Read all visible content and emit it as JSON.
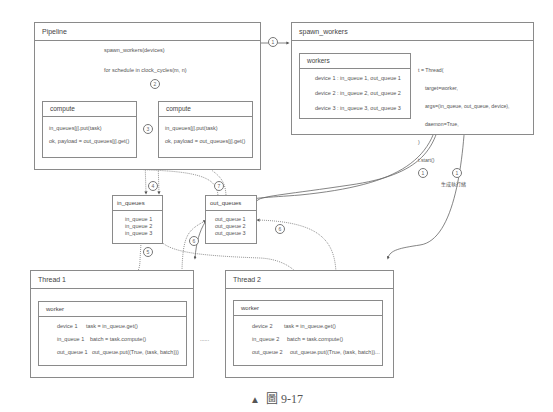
{
  "pipeline": {
    "title": "Pipeline",
    "spawn_call": "spawn_workers(devices)",
    "loop": "for schedule in clock_cycles(m, n)",
    "compute_boxes": [
      {
        "title": "compute",
        "line1": "in_queues[j].put(task)",
        "line2": "ok, payload = out_queues[j].get()"
      },
      {
        "title": "compute",
        "line1": "in_queues[j].put(task)",
        "line2": "ok, payload = out_queues[j].get()"
      }
    ]
  },
  "spawn_workers": {
    "title": "spawn_workers",
    "workers": {
      "title": "workers",
      "rows": [
        "device 1 : in_queue 1, out_queue 1",
        "device 2 : in_queue 2, out_queue 2",
        "device 3 : in_queue 3, out_queue 3"
      ]
    },
    "code": [
      "t = Thread(",
      "  target=worker,",
      "  args=(in_queue, out_queue, device),",
      "  daemon=True,",
      ")",
      "t.start()"
    ]
  },
  "annotation": "生成執行緒",
  "in_queues": {
    "title": "in_queues",
    "items": [
      "in_queue 1",
      "in_queue 2",
      "in_queue 3"
    ]
  },
  "out_queues": {
    "title": "out_queues",
    "items": [
      "out_queue 1",
      "out_queue 2",
      "out_queue 3"
    ]
  },
  "threads": [
    {
      "title": "Thread 1",
      "worker_title": "worker",
      "rows": [
        {
          "label": "device 1",
          "code": "task = in_queue.get()"
        },
        {
          "label": "in_queue 1",
          "code": "batch = task.compute()"
        },
        {
          "label": "out_queue 1",
          "code": "out_queue.put((True, (task, batch)))"
        }
      ]
    },
    {
      "title": "Thread 2",
      "worker_title": "worker",
      "rows": [
        {
          "label": "device 2",
          "code": "task = in_queue.get()"
        },
        {
          "label": "in_queue 2",
          "code": "batch = task.compute()"
        },
        {
          "label": "out_queue 2",
          "code": "out_queue.put((True, (task, batch))..."
        }
      ]
    }
  ],
  "ellipsis": "......",
  "steps": {
    "s1": "1",
    "s2": "2",
    "s3": "3",
    "s4": "4",
    "s5": "5",
    "s6": "6",
    "s7": "7"
  },
  "caption": {
    "marker": "▲",
    "text": "圖 9-17"
  }
}
